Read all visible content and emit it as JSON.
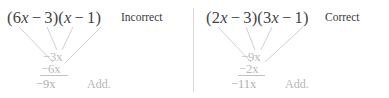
{
  "figure": {
    "caption_add_label": "Add.",
    "colors": {
      "expression_text": "#444444",
      "verdict_text": "#3a3a3a",
      "term_text": "#b9b9b9",
      "sum_text": "#b0b0b0",
      "connector_line": "#c9c9c9",
      "divider": "#d8d8d8",
      "background": "#ffffff"
    }
  },
  "panels": [
    {
      "id": "incorrect",
      "verdict": "Incorrect",
      "expression": {
        "full": "(6x − 3)(x − 1)",
        "first_factor": {
          "open_paren": "(",
          "coefficient": "6",
          "variable": "x",
          "operator": "−",
          "constant": "3",
          "close_paren": ")"
        },
        "second_factor": {
          "open_paren": "(",
          "coefficient": "",
          "variable": "x",
          "operator": "−",
          "constant": "1",
          "close_paren": ")"
        }
      },
      "inner_product": "−3x",
      "outer_product": "−6x",
      "sum": "−9x",
      "add_label": "Add."
    },
    {
      "id": "correct",
      "verdict": "Correct",
      "expression": {
        "full": "(2x − 3)(3x − 1)",
        "first_factor": {
          "open_paren": "(",
          "coefficient": "2",
          "variable": "x",
          "operator": "−",
          "constant": "3",
          "close_paren": ")"
        },
        "second_factor": {
          "open_paren": "(",
          "coefficient": "3",
          "variable": "x",
          "operator": "−",
          "constant": "1",
          "close_paren": ")"
        }
      },
      "inner_product": "−9x",
      "outer_product": "−2x",
      "sum": "−11x",
      "add_label": "Add."
    }
  ]
}
